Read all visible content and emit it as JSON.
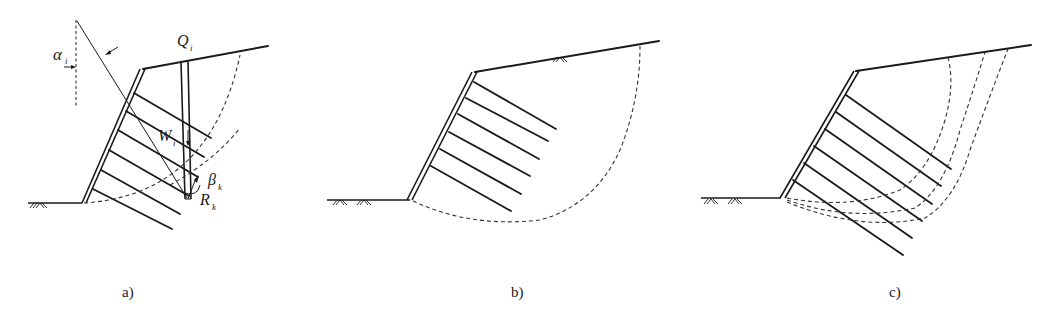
{
  "figure": {
    "panels": [
      {
        "id": "a",
        "caption": "a)",
        "labels": {
          "alpha": "α",
          "alpha_sub": "i",
          "Q": "Q",
          "Q_sub": "i",
          "W": "W",
          "W_sub": "i",
          "beta": "β",
          "beta_sub": "k",
          "R": "R",
          "R_sub": "k"
        },
        "anchor_count": 6,
        "slip_surface": "circular (dashed)"
      },
      {
        "id": "b",
        "caption": "b)",
        "anchor_count": 6,
        "slip_surface": "deep circular (dashed)"
      },
      {
        "id": "c",
        "caption": "c)",
        "anchor_count": 6,
        "slip_surface": "three trial surfaces (dashed)"
      }
    ],
    "colors": {
      "line": "#1a1a1a",
      "dash": "#333333",
      "background": "#ffffff"
    }
  }
}
